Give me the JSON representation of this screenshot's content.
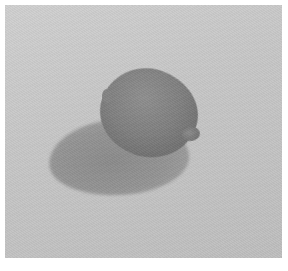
{
  "image": {
    "description": "Grayscale photograph of a single lemon on a plain surface casting a shadow to the lower left",
    "subject": "lemon",
    "style": "black-and-white photograph",
    "colors": {
      "border": "#ffffff",
      "background": "#c6c6c6",
      "lemon": "#7a7a7a",
      "shadow": "#8f8f8f"
    }
  }
}
